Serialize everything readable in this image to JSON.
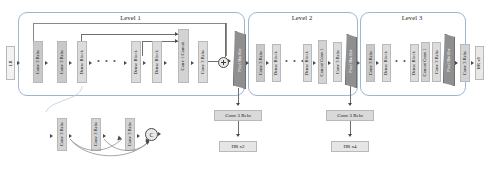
{
  "figure": {
    "type": "neural-network-architecture-diagram"
  },
  "levels": [
    {
      "id": "level1",
      "title": "Level 1"
    },
    {
      "id": "level2",
      "title": "Level 2"
    },
    {
      "id": "level3",
      "title": "Level 3"
    }
  ],
  "input": {
    "label": "LR"
  },
  "outputs": [
    {
      "label": "HR x2"
    },
    {
      "label": "HR x4"
    },
    {
      "label": "HR x8"
    }
  ],
  "tail_convs": [
    {
      "label": "Conv 3 Relu"
    },
    {
      "label": "Conv 3 Relu"
    }
  ],
  "level1_blocks": [
    {
      "label": "Conv 3 Relu",
      "tone": "gray"
    },
    {
      "label": "Conv 3 Relu",
      "tone": "gray"
    },
    {
      "label": "Dense Block",
      "tone": "lgray"
    },
    {
      "label": "Dense Block",
      "tone": "lgray"
    },
    {
      "label": "Dense Block",
      "tone": "lgray"
    },
    {
      "label": "Conv 1 Concat",
      "tone": "mid"
    },
    {
      "label": "Conv 3 Relu",
      "tone": "lgray"
    }
  ],
  "level1_shuffle": {
    "label": "Pixel Shuffler"
  },
  "level2_blocks": [
    {
      "label": "Conv 3 Relu",
      "tone": "gray"
    },
    {
      "label": "Dense Block",
      "tone": "lgray"
    },
    {
      "label": "Dense Block",
      "tone": "lgray"
    },
    {
      "label": "Concat Conv 1",
      "tone": "mid"
    },
    {
      "label": "Conv 3 Relu",
      "tone": "lgray"
    }
  ],
  "level2_shuffle": {
    "label": "Pixel Shuffler"
  },
  "level3_blocks": [
    {
      "label": "Conv 3 Relu",
      "tone": "gray"
    },
    {
      "label": "Dense Block",
      "tone": "lgray"
    },
    {
      "label": "Dense Block",
      "tone": "lgray"
    },
    {
      "label": "Concat Conv 1",
      "tone": "mid"
    },
    {
      "label": "Conv 3 Relu",
      "tone": "lgray"
    }
  ],
  "level3_shuffle": {
    "label": "Pixel Shuffler"
  },
  "level3_tail": {
    "label": "Conv 3 Relu"
  },
  "dense_block_detail": {
    "convs": [
      {
        "label": "Conv 3 Relu"
      },
      {
        "label": "Conv 3 Relu"
      },
      {
        "label": "Conv 3 Relu"
      }
    ],
    "concat_node": "C"
  },
  "ellipsis": "• • •",
  "colors": {
    "level_border": "#9fb6cf",
    "block_gray": "#c9c9c9",
    "block_light": "#dcdcdc",
    "block_mid": "#d3d3d3",
    "shuffle": "#8f8f8f",
    "connector": "#4a4a4a",
    "label_box": "#d9d9d9"
  }
}
